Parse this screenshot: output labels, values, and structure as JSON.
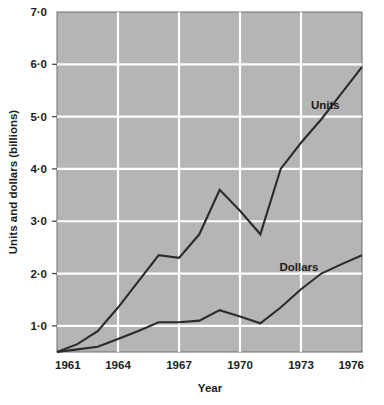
{
  "chart_data": {
    "type": "line",
    "title": "",
    "xlabel": "Year",
    "ylabel": "Units and dollars (billions)",
    "xlim": [
      1961,
      1976
    ],
    "ylim": [
      0.5,
      7.0
    ],
    "grid": true,
    "grid_color": "#ffffff",
    "plot_background": "#b5b5b5",
    "line_color": "#2b2b2b",
    "legend_position": "inline-labels",
    "x_ticks": [
      "1961",
      "1964",
      "1967",
      "1970",
      "1973",
      "1976"
    ],
    "x_tick_values": [
      1961,
      1964,
      1967,
      1970,
      1973,
      1976
    ],
    "y_ticks": [
      "1·0",
      "2·0",
      "3·0",
      "4·0",
      "5·0",
      "6·0",
      "7·0"
    ],
    "y_tick_values": [
      1.0,
      2.0,
      3.0,
      4.0,
      5.0,
      6.0,
      7.0
    ],
    "x": [
      1961,
      1962,
      1963,
      1964,
      1965,
      1966,
      1967,
      1968,
      1969,
      1970,
      1971,
      1972,
      1973,
      1974,
      1975,
      1976
    ],
    "series": [
      {
        "name": "Units",
        "label": "Units",
        "label_x": 1974.2,
        "label_y": 5.15,
        "values": [
          0.5,
          0.65,
          0.9,
          1.35,
          1.85,
          2.35,
          2.3,
          2.75,
          3.6,
          3.2,
          2.75,
          4.0,
          4.5,
          4.95,
          5.45,
          5.95
        ]
      },
      {
        "name": "Dollars",
        "label": "Dollars",
        "label_x": 1972.9,
        "label_y": 2.05,
        "values": [
          0.5,
          0.55,
          0.6,
          0.75,
          0.9,
          1.07,
          1.07,
          1.1,
          1.3,
          1.18,
          1.05,
          1.35,
          1.7,
          2.0,
          2.18,
          2.35
        ]
      }
    ]
  },
  "annotations": {
    "axis_label_year": "Year",
    "axis_label_units_dollars": "Units and dollars (billions)"
  }
}
